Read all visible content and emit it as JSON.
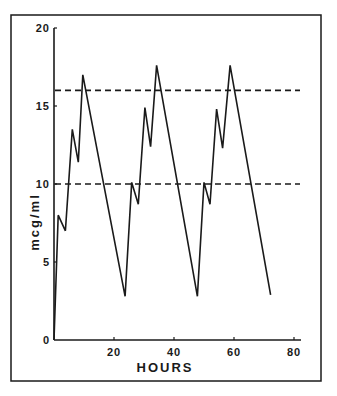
{
  "chart_data": {
    "type": "line",
    "title": "",
    "xlabel": "HOURS",
    "ylabel": "mcg/ml",
    "xlim": [
      0,
      80
    ],
    "ylim": [
      0,
      20
    ],
    "x_ticks": [
      20,
      40,
      60,
      80
    ],
    "x_tick_labels": [
      "20",
      "40",
      "60",
      "80"
    ],
    "y_ticks": [
      0,
      5,
      10,
      15,
      20
    ],
    "y_tick_labels": [
      "0",
      "5",
      "10",
      "15",
      "20"
    ],
    "grid": false,
    "legend": null,
    "series": [
      {
        "name": "serum concentration",
        "style": "solid",
        "x": [
          0,
          1.4,
          3.8,
          6.1,
          8.1,
          9.6,
          23.7,
          25.9,
          28.1,
          30.3,
          32.2,
          34.2,
          47.8,
          50.0,
          52.0,
          54.2,
          56.2,
          58.7,
          72.2
        ],
        "y": [
          0,
          8.0,
          7.0,
          13.5,
          11.4,
          17.0,
          2.8,
          10.1,
          8.7,
          14.9,
          12.4,
          17.6,
          2.8,
          10.1,
          8.7,
          14.8,
          12.3,
          17.6,
          2.9
        ]
      }
    ],
    "reference_lines": [
      {
        "name": "upper therapeutic limit",
        "style": "dashed",
        "y": 16,
        "x_range": [
          0,
          82
        ]
      },
      {
        "name": "lower therapeutic limit",
        "style": "dashed",
        "y": 10,
        "x_range": [
          0,
          82
        ]
      }
    ]
  },
  "labels": {
    "x_axis_title": "HOURS",
    "y_axis_title": "mcg/ml",
    "x_ticks": [
      "20",
      "40",
      "60",
      "80"
    ],
    "y_ticks": [
      "0",
      "5",
      "10",
      "15",
      "20"
    ]
  },
  "colors": {
    "line": "#1a1a1a",
    "background": "#ffffff"
  }
}
